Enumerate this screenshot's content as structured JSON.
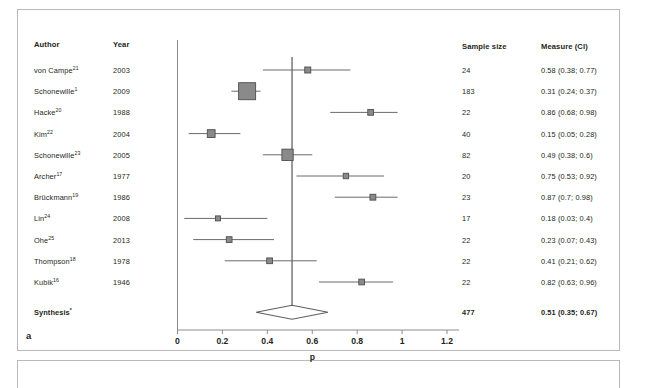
{
  "panel": {
    "letter": "a"
  },
  "columns": {
    "author": "Author",
    "year": "Year",
    "sample_size": "Sample size",
    "measure": "Measure (CI)"
  },
  "chart_data": {
    "type": "forest",
    "title": "",
    "xlabel": "p",
    "ylabel": "",
    "xlim": [
      0,
      1.2
    ],
    "xticks": [
      0,
      0.2,
      0.4,
      0.6,
      0.8,
      1,
      1.2
    ],
    "xtick_labels": [
      "0",
      "0.2",
      "0.4",
      "0.6",
      "0.8",
      "1",
      "1.2"
    ],
    "grid": false,
    "legend": "none",
    "reference_line": 0.51,
    "rows": [
      {
        "author": "von Campe",
        "ref": "21",
        "year": "2003",
        "n": "24",
        "measure_text": "0.58 (0.38; 0.77)",
        "estimate": 0.58,
        "ci_low": 0.38,
        "ci_high": 0.77,
        "weight": 24
      },
      {
        "author": "Schonewille",
        "ref": "1",
        "year": "2009",
        "n": "183",
        "measure_text": "0.31 (0.24; 0.37)",
        "estimate": 0.31,
        "ci_low": 0.24,
        "ci_high": 0.37,
        "weight": 183
      },
      {
        "author": "Hacke",
        "ref": "20",
        "year": "1988",
        "n": "22",
        "measure_text": "0.86 (0.68; 0.98)",
        "estimate": 0.86,
        "ci_low": 0.68,
        "ci_high": 0.98,
        "weight": 22
      },
      {
        "author": "Kim",
        "ref": "22",
        "year": "2004",
        "n": "40",
        "measure_text": "0.15 (0.05; 0.28)",
        "estimate": 0.15,
        "ci_low": 0.05,
        "ci_high": 0.28,
        "weight": 40
      },
      {
        "author": "Schonewille",
        "ref": "23",
        "year": "2005",
        "n": "82",
        "measure_text": "0.49 (0.38; 0.6)",
        "estimate": 0.49,
        "ci_low": 0.38,
        "ci_high": 0.6,
        "weight": 82
      },
      {
        "author": "Archer",
        "ref": "17",
        "year": "1977",
        "n": "20",
        "measure_text": "0.75 (0.53; 0.92)",
        "estimate": 0.75,
        "ci_low": 0.53,
        "ci_high": 0.92,
        "weight": 20
      },
      {
        "author": "Brückmann",
        "ref": "19",
        "year": "1986",
        "n": "23",
        "measure_text": "0.87 (0.7; 0.98)",
        "estimate": 0.87,
        "ci_low": 0.7,
        "ci_high": 0.98,
        "weight": 23
      },
      {
        "author": "Lin",
        "ref": "24",
        "year": "2008",
        "n": "17",
        "measure_text": "0.18 (0.03; 0.4)",
        "estimate": 0.18,
        "ci_low": 0.03,
        "ci_high": 0.4,
        "weight": 17
      },
      {
        "author": "Ohe",
        "ref": "25",
        "year": "2013",
        "n": "22",
        "measure_text": "0.23 (0.07; 0.43)",
        "estimate": 0.23,
        "ci_low": 0.07,
        "ci_high": 0.43,
        "weight": 22
      },
      {
        "author": "Thompson",
        "ref": "18",
        "year": "1978",
        "n": "22",
        "measure_text": "0.41 (0.21; 0.62)",
        "estimate": 0.41,
        "ci_low": 0.21,
        "ci_high": 0.62,
        "weight": 22
      },
      {
        "author": "Kubik",
        "ref": "16",
        "year": "1946",
        "n": "22",
        "measure_text": "0.82 (0.63; 0.96)",
        "estimate": 0.82,
        "ci_low": 0.63,
        "ci_high": 0.96,
        "weight": 22
      }
    ],
    "summary": {
      "author": "Synthesis",
      "ref": "*",
      "year": "",
      "n": "477",
      "measure_text": "0.51 (0.35; 0.67)",
      "estimate": 0.51,
      "ci_low": 0.35,
      "ci_high": 0.67
    }
  },
  "colors": {
    "marker_fill": "#8a8a8a",
    "marker_stroke": "#4d4d4d",
    "axis": "#8c8c8c",
    "text": "#231f20",
    "frame": "#b9b9b9"
  }
}
